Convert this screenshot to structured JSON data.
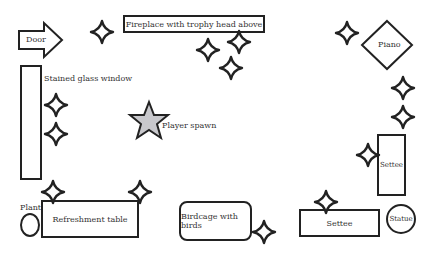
{
  "diagram": {
    "title": "",
    "objects": {
      "door": {
        "label": "Door"
      },
      "fireplace": {
        "label": "Fireplace with trophy head above"
      },
      "piano": {
        "label": "Piano"
      },
      "window": {
        "label": "Stained glass window"
      },
      "spawn": {
        "label": "Player spawn"
      },
      "plant": {
        "label": "Plant"
      },
      "table": {
        "label": "Refreshment table"
      },
      "birdcage": {
        "label": "Birdcage with birds"
      },
      "settee_vertical": {
        "label": "Settee"
      },
      "settee_horizontal": {
        "label": "Settee"
      },
      "statue": {
        "label": "Statue"
      }
    },
    "sparkle_markers": 15,
    "colors": {
      "stroke": "#222222",
      "spawn_fill": "#c8c8cc",
      "background": "#ffffff"
    }
  }
}
